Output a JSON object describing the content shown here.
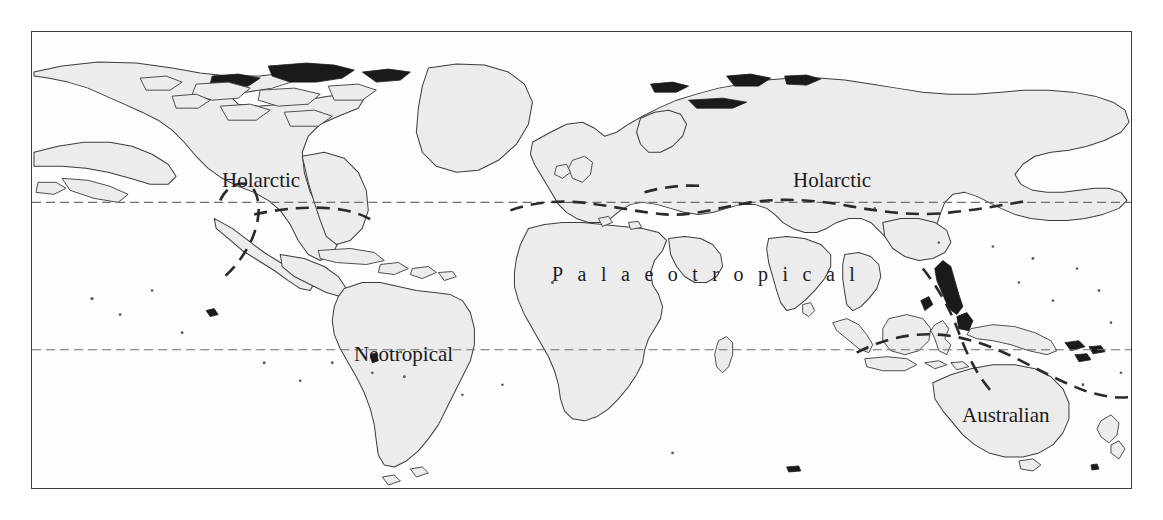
{
  "figure": {
    "type": "biogeographic-region-map",
    "projection": "cylindrical-equal-area",
    "background_color": "#ffffff",
    "ocean_color": "#fdfdfd",
    "land_color": "#ececec",
    "coastline_color": "#3c3c3c",
    "frame_color": "#3d3d3d",
    "boundary_color": "#2a2a2a",
    "tropic_line_color": "#6e6e6e"
  },
  "labels": {
    "holarctic_north_america": "Holarctic",
    "holarctic_eurasia": "Holarctic",
    "neotropical": "Neotropical",
    "palaeotropical": "Palaeotropical",
    "australian": "Australian"
  },
  "regions": [
    {
      "name": "Holarctic",
      "label": "Holarctic"
    },
    {
      "name": "Neotropical",
      "label": "Neotropical"
    },
    {
      "name": "Palaeotropical",
      "label": "Palaeotropical"
    },
    {
      "name": "Australian",
      "label": "Australian"
    }
  ],
  "reference_lines": [
    {
      "name": "tropic-of-cancer",
      "style": "dashed",
      "y_px": 202
    },
    {
      "name": "tropic-of-capricorn",
      "style": "dashed",
      "y_px": 349
    }
  ],
  "boundaries": [
    {
      "name": "holarctic-neotropical-boundary",
      "style": "thick-dashed"
    },
    {
      "name": "holarctic-palaeotropical-boundary",
      "style": "thick-dashed"
    },
    {
      "name": "palaeotropical-australian-boundary",
      "style": "thick-dashed"
    }
  ]
}
